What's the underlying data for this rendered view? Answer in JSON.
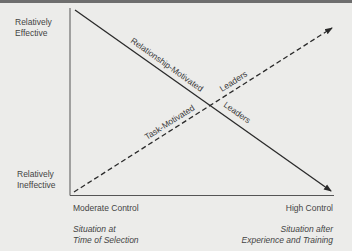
{
  "diagram": {
    "y_axis": {
      "top_label_line1": "Relatively",
      "top_label_line2": "Effective",
      "bottom_label_line1": "Relatively",
      "bottom_label_line2": "Ineffective"
    },
    "x_axis": {
      "left_label": "Moderate Control",
      "right_label": "High Control",
      "left_caption_line1": "Situation at",
      "left_caption_line2": "Time of Selection",
      "right_caption_line1": "Situation after",
      "right_caption_line2": "Experience and Training"
    },
    "lines": [
      {
        "name": "relationship-motivated",
        "style": "solid",
        "label_part1": "Relationship-Motivated",
        "label_part2": "Leaders",
        "direction": "decreasing"
      },
      {
        "name": "task-motivated",
        "style": "dashed",
        "label_part1": "Task-Motivated",
        "label_part2": "Leaders",
        "direction": "increasing"
      }
    ],
    "colors": {
      "background": "#ececea",
      "line": "#2a2a2a",
      "axis": "#555555"
    }
  }
}
